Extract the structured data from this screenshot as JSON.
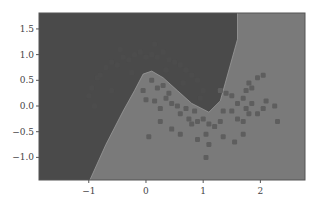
{
  "chart_data": {
    "type": "scatter",
    "title": "",
    "xlabel": "",
    "ylabel": "",
    "xlim": [
      -1.87,
      2.78
    ],
    "ylim": [
      -1.44,
      1.81
    ],
    "x_ticks": [
      -1,
      0,
      1,
      2
    ],
    "x_tick_labels": [
      "-1",
      "0",
      "1",
      "2"
    ],
    "y_ticks": [
      -1.0,
      -0.5,
      0.0,
      0.5,
      1.0,
      1.5
    ],
    "y_tick_labels": [
      "-1.0",
      "-0.5",
      "0.0",
      "0.5",
      "1.0",
      "1.5"
    ],
    "grid": false,
    "legend": null,
    "decision_boundary": [
      [
        -0.98,
        -1.44
      ],
      [
        -0.7,
        -0.75
      ],
      [
        -0.4,
        -0.1
      ],
      [
        -0.2,
        0.3
      ],
      [
        -0.05,
        0.62
      ],
      [
        0.1,
        0.68
      ],
      [
        0.3,
        0.55
      ],
      [
        0.55,
        0.3
      ],
      [
        0.8,
        0.05
      ],
      [
        1.1,
        -0.12
      ],
      [
        1.3,
        0.1
      ],
      [
        1.45,
        0.7
      ],
      [
        1.6,
        1.3
      ],
      [
        1.6,
        1.81
      ]
    ],
    "series": [
      {
        "name": "class 0",
        "color": "#4c4c4c",
        "points": [
          [
            -1.0,
            0.2
          ],
          [
            -0.95,
            0.35
          ],
          [
            -0.85,
            0.55
          ],
          [
            -0.8,
            0.6
          ],
          [
            -0.7,
            0.75
          ],
          [
            -0.6,
            0.85
          ],
          [
            -0.5,
            0.8
          ],
          [
            -0.4,
            0.95
          ],
          [
            -0.3,
            0.9
          ],
          [
            -0.2,
            1.0
          ],
          [
            -0.1,
            1.05
          ],
          [
            0.0,
            0.95
          ],
          [
            0.1,
            1.0
          ],
          [
            0.2,
            0.95
          ],
          [
            0.3,
            1.05
          ],
          [
            0.4,
            0.9
          ],
          [
            0.5,
            0.85
          ],
          [
            0.6,
            0.8
          ],
          [
            0.7,
            0.7
          ],
          [
            0.8,
            0.6
          ],
          [
            0.9,
            0.5
          ],
          [
            1.0,
            0.3
          ],
          [
            0.95,
            0.15
          ],
          [
            -0.9,
            0.0
          ],
          [
            -0.6,
            0.3
          ],
          [
            0.35,
            0.7
          ],
          [
            0.65,
            0.45
          ],
          [
            -0.25,
            0.65
          ],
          [
            0.15,
            1.2
          ],
          [
            -0.45,
            1.1
          ]
        ]
      },
      {
        "name": "class 1",
        "color": "#5e5e5e",
        "points": [
          [
            -0.05,
            0.3
          ],
          [
            0.1,
            0.5
          ],
          [
            0.2,
            0.35
          ],
          [
            0.3,
            0.4
          ],
          [
            0.4,
            0.25
          ],
          [
            0.45,
            0.05
          ],
          [
            0.0,
            0.12
          ],
          [
            0.15,
            0.1
          ],
          [
            0.25,
            -0.05
          ],
          [
            0.35,
            0.15
          ],
          [
            0.55,
            0.0
          ],
          [
            0.6,
            -0.15
          ],
          [
            0.7,
            -0.05
          ],
          [
            0.75,
            -0.25
          ],
          [
            0.85,
            -0.1
          ],
          [
            0.8,
            -0.35
          ],
          [
            0.9,
            -0.3
          ],
          [
            1.0,
            -0.25
          ],
          [
            1.1,
            -0.35
          ],
          [
            1.2,
            -0.4
          ],
          [
            1.3,
            -0.3
          ],
          [
            1.35,
            -0.1
          ],
          [
            1.5,
            -0.1
          ],
          [
            1.6,
            -0.25
          ],
          [
            1.7,
            -0.3
          ],
          [
            1.75,
            -0.05
          ],
          [
            1.8,
            -0.15
          ],
          [
            1.85,
            0.05
          ],
          [
            1.95,
            -0.15
          ],
          [
            2.05,
            -0.05
          ],
          [
            1.6,
            0.05
          ],
          [
            1.7,
            0.15
          ],
          [
            1.75,
            0.3
          ],
          [
            1.8,
            0.45
          ],
          [
            1.85,
            0.35
          ],
          [
            1.95,
            0.55
          ],
          [
            2.05,
            0.6
          ],
          [
            2.1,
            0.1
          ],
          [
            2.25,
            0.0
          ],
          [
            2.3,
            -0.3
          ],
          [
            1.3,
            0.3
          ],
          [
            1.4,
            0.25
          ],
          [
            1.5,
            0.2
          ],
          [
            1.05,
            -0.55
          ],
          [
            1.35,
            -0.6
          ],
          [
            1.7,
            -0.55
          ],
          [
            1.1,
            -0.75
          ],
          [
            0.9,
            -0.65
          ],
          [
            0.45,
            -0.45
          ],
          [
            0.25,
            -0.3
          ],
          [
            0.05,
            -0.6
          ],
          [
            0.6,
            -0.55
          ],
          [
            1.55,
            -0.7
          ],
          [
            1.05,
            -1.0
          ]
        ]
      }
    ],
    "region_colors": {
      "class_0": "#4a4a4a",
      "class_1": "#7a7a7a"
    }
  }
}
